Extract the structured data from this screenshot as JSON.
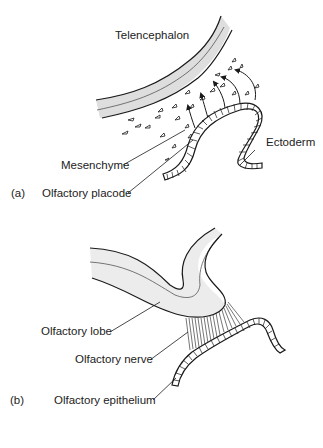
{
  "panel_a": {
    "letter": "(a)",
    "labels": {
      "telencephalon": "Telencephalon",
      "ectoderm": "Ectoderm",
      "mesenchyme": "Mesenchyme",
      "olfactory_placode": "Olfactory placode"
    }
  },
  "panel_b": {
    "letter": "(b)",
    "labels": {
      "olfactory_lobe": "Olfactory lobe",
      "olfactory_nerve": "Olfactory nerve",
      "olfactory_epithelium": "Olfactory epithelium"
    }
  },
  "colors": {
    "ink": "#1a1a1a",
    "tissue_fill": "#e2e2e2",
    "lobe_fill": "#ececec"
  }
}
